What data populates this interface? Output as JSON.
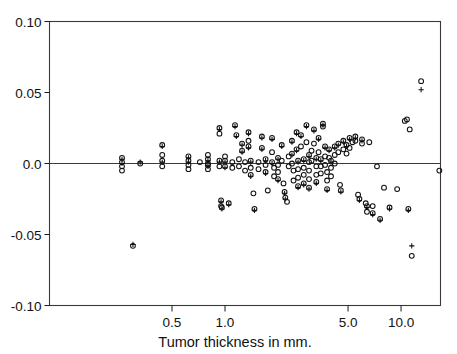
{
  "chart_data": {
    "type": "scatter",
    "title": "",
    "xlabel": "Tumor thickness in mm.",
    "ylabel": "",
    "xscale": "log",
    "yscale": "linear",
    "xlim": [
      0.18,
      20.0
    ],
    "ylim": [
      -0.1,
      0.1
    ],
    "xticks": [
      0.5,
      1.0,
      5.0,
      10.0
    ],
    "xtick_labels": [
      "0.5",
      "1.0",
      "5.0",
      "10.0"
    ],
    "yticks": [
      -0.1,
      -0.05,
      0.0,
      0.05,
      0.1
    ],
    "ytick_labels": [
      "-0.10",
      "-0.05",
      "0.0",
      "0.05",
      "0.10"
    ],
    "grid": false,
    "legend": "none",
    "zero_reference_line": 0.0,
    "marker_styles": [
      "circle",
      "plus"
    ],
    "series": [
      {
        "name": "circle",
        "marker": "circle",
        "points": [
          [
            0.26,
            0.001
          ],
          [
            0.26,
            -0.002
          ],
          [
            0.26,
            0.004
          ],
          [
            0.26,
            -0.005
          ],
          [
            0.33,
            0.0
          ],
          [
            0.3,
            -0.058
          ],
          [
            0.44,
            0.013
          ],
          [
            0.44,
            0.002
          ],
          [
            0.44,
            -0.002
          ],
          [
            0.44,
            0.006
          ],
          [
            0.62,
            0.002
          ],
          [
            0.62,
            -0.001
          ],
          [
            0.62,
            0.005
          ],
          [
            0.62,
            -0.004
          ],
          [
            0.72,
            0.001
          ],
          [
            0.8,
            0.003
          ],
          [
            0.8,
            -0.001
          ],
          [
            0.8,
            0.006
          ],
          [
            0.8,
            -0.004
          ],
          [
            0.8,
            0.0
          ],
          [
            0.93,
            0.025
          ],
          [
            0.93,
            0.021
          ],
          [
            0.93,
            0.002
          ],
          [
            0.93,
            -0.002
          ],
          [
            0.95,
            -0.026
          ],
          [
            0.95,
            -0.03
          ],
          [
            0.96,
            -0.031
          ],
          [
            1.0,
            0.002
          ],
          [
            1.0,
            -0.002
          ],
          [
            1.0,
            0.005
          ],
          [
            1.05,
            -0.028
          ],
          [
            1.1,
            0.001
          ],
          [
            1.1,
            -0.003
          ],
          [
            1.14,
            0.027
          ],
          [
            1.16,
            0.02
          ],
          [
            1.2,
            0.003
          ],
          [
            1.2,
            -0.002
          ],
          [
            1.25,
            0.014
          ],
          [
            1.25,
            0.009
          ],
          [
            1.3,
            0.001
          ],
          [
            1.3,
            -0.005
          ],
          [
            1.36,
            0.022
          ],
          [
            1.36,
            0.016
          ],
          [
            1.36,
            0.012
          ],
          [
            1.4,
            0.002
          ],
          [
            1.4,
            -0.003
          ],
          [
            1.4,
            -0.008
          ],
          [
            1.45,
            -0.021
          ],
          [
            1.47,
            -0.032
          ],
          [
            1.55,
            0.001
          ],
          [
            1.55,
            -0.004
          ],
          [
            1.62,
            0.019
          ],
          [
            1.62,
            0.011
          ],
          [
            1.7,
            0.003
          ],
          [
            1.7,
            -0.001
          ],
          [
            1.7,
            -0.006
          ],
          [
            1.75,
            -0.019
          ],
          [
            1.85,
            0.018
          ],
          [
            1.85,
            0.008
          ],
          [
            1.85,
            0.001
          ],
          [
            1.9,
            -0.003
          ],
          [
            1.9,
            -0.009
          ],
          [
            2.0,
            0.004
          ],
          [
            2.0,
            -0.001
          ],
          [
            2.0,
            -0.006
          ],
          [
            2.0,
            -0.011
          ],
          [
            2.1,
            0.013
          ],
          [
            2.1,
            0.002
          ],
          [
            2.15,
            -0.014
          ],
          [
            2.18,
            -0.02
          ],
          [
            2.2,
            -0.024
          ],
          [
            2.25,
            -0.027
          ],
          [
            2.3,
            0.005
          ],
          [
            2.3,
            -0.002
          ],
          [
            2.4,
            0.016
          ],
          [
            2.4,
            0.007
          ],
          [
            2.4,
            0.0
          ],
          [
            2.45,
            -0.005
          ],
          [
            2.45,
            -0.012
          ],
          [
            2.55,
            0.022
          ],
          [
            2.55,
            0.01
          ],
          [
            2.6,
            0.002
          ],
          [
            2.6,
            -0.004
          ],
          [
            2.6,
            -0.01
          ],
          [
            2.6,
            -0.016
          ],
          [
            2.7,
            0.02
          ],
          [
            2.7,
            0.012
          ],
          [
            2.8,
            0.003
          ],
          [
            2.8,
            -0.003
          ],
          [
            2.8,
            -0.008
          ],
          [
            2.8,
            -0.014
          ],
          [
            2.9,
            0.027
          ],
          [
            2.9,
            0.015
          ],
          [
            3.0,
            0.006
          ],
          [
            3.0,
            0.001
          ],
          [
            3.0,
            -0.005
          ],
          [
            3.0,
            -0.011
          ],
          [
            3.0,
            -0.017
          ],
          [
            3.1,
            0.009
          ],
          [
            3.1,
            0.002
          ],
          [
            3.2,
            0.024
          ],
          [
            3.2,
            0.014
          ],
          [
            3.3,
            0.004
          ],
          [
            3.3,
            -0.002
          ],
          [
            3.3,
            -0.008
          ],
          [
            3.3,
            -0.013
          ],
          [
            3.4,
            0.018
          ],
          [
            3.4,
            0.008
          ],
          [
            3.5,
            0.003
          ],
          [
            3.5,
            -0.002
          ],
          [
            3.5,
            -0.007
          ],
          [
            3.6,
            0.028
          ],
          [
            3.6,
            0.026
          ],
          [
            3.7,
            0.012
          ],
          [
            3.7,
            0.005
          ],
          [
            3.7,
            -0.001
          ],
          [
            3.8,
            -0.006
          ],
          [
            3.8,
            -0.012
          ],
          [
            3.8,
            -0.018
          ],
          [
            3.9,
            0.01
          ],
          [
            3.9,
            0.004
          ],
          [
            4.0,
            0.002
          ],
          [
            4.0,
            -0.003
          ],
          [
            4.0,
            -0.009
          ],
          [
            4.2,
            0.012
          ],
          [
            4.2,
            0.006
          ],
          [
            4.2,
            0.0
          ],
          [
            4.4,
            0.014
          ],
          [
            4.4,
            0.008
          ],
          [
            4.5,
            -0.015
          ],
          [
            4.55,
            -0.019
          ],
          [
            4.7,
            0.016
          ],
          [
            4.7,
            0.01
          ],
          [
            4.9,
            0.013
          ],
          [
            4.9,
            0.007
          ],
          [
            5.1,
            0.018
          ],
          [
            5.1,
            0.011
          ],
          [
            5.3,
            0.015
          ],
          [
            5.5,
            0.019
          ],
          [
            5.5,
            0.016
          ],
          [
            5.7,
            -0.022
          ],
          [
            5.8,
            -0.025
          ],
          [
            6.0,
            0.017
          ],
          [
            6.0,
            0.014
          ],
          [
            6.3,
            -0.028
          ],
          [
            6.4,
            -0.03
          ],
          [
            6.4,
            -0.034
          ],
          [
            6.6,
            0.015
          ],
          [
            6.9,
            -0.03
          ],
          [
            6.9,
            -0.035
          ],
          [
            7.3,
            -0.002
          ],
          [
            7.6,
            -0.039
          ],
          [
            8.0,
            -0.017
          ],
          [
            8.6,
            -0.031
          ],
          [
            9.5,
            -0.018
          ],
          [
            10.5,
            0.03
          ],
          [
            10.8,
            0.031
          ],
          [
            11.0,
            -0.032
          ],
          [
            11.2,
            0.024
          ],
          [
            11.5,
            -0.065
          ],
          [
            13.0,
            0.058
          ],
          [
            16.5,
            -0.005
          ]
        ]
      },
      {
        "name": "plus",
        "marker": "plus",
        "points": [
          [
            0.26,
            0.0
          ],
          [
            0.26,
            0.003
          ],
          [
            0.33,
            0.001
          ],
          [
            0.3,
            -0.057
          ],
          [
            0.44,
            0.012
          ],
          [
            0.44,
            0.001
          ],
          [
            0.62,
            0.001
          ],
          [
            0.62,
            0.004
          ],
          [
            0.8,
            0.002
          ],
          [
            0.8,
            -0.002
          ],
          [
            0.93,
            0.024
          ],
          [
            0.93,
            0.001
          ],
          [
            0.95,
            -0.027
          ],
          [
            0.96,
            -0.032
          ],
          [
            1.0,
            0.001
          ],
          [
            1.0,
            -0.003
          ],
          [
            1.05,
            -0.029
          ],
          [
            1.14,
            0.026
          ],
          [
            1.16,
            0.019
          ],
          [
            1.25,
            0.013
          ],
          [
            1.25,
            0.008
          ],
          [
            1.36,
            0.021
          ],
          [
            1.36,
            0.011
          ],
          [
            1.4,
            0.001
          ],
          [
            1.4,
            -0.009
          ],
          [
            1.47,
            -0.033
          ],
          [
            1.62,
            0.018
          ],
          [
            1.62,
            0.01
          ],
          [
            1.7,
            0.002
          ],
          [
            1.7,
            -0.007
          ],
          [
            1.85,
            0.017
          ],
          [
            1.85,
            0.0
          ],
          [
            2.0,
            0.003
          ],
          [
            2.0,
            -0.012
          ],
          [
            2.1,
            0.012
          ],
          [
            2.18,
            -0.021
          ],
          [
            2.2,
            -0.025
          ],
          [
            2.4,
            0.015
          ],
          [
            2.4,
            0.006
          ],
          [
            2.55,
            0.021
          ],
          [
            2.55,
            0.009
          ],
          [
            2.6,
            0.001
          ],
          [
            2.6,
            -0.017
          ],
          [
            2.7,
            0.019
          ],
          [
            2.8,
            0.002
          ],
          [
            2.8,
            -0.015
          ],
          [
            2.9,
            0.026
          ],
          [
            3.0,
            0.005
          ],
          [
            3.0,
            -0.018
          ],
          [
            3.2,
            0.023
          ],
          [
            3.3,
            0.003
          ],
          [
            3.3,
            -0.014
          ],
          [
            3.4,
            0.017
          ],
          [
            3.5,
            0.002
          ],
          [
            3.6,
            0.027
          ],
          [
            3.7,
            0.011
          ],
          [
            3.8,
            -0.019
          ],
          [
            3.9,
            0.009
          ],
          [
            4.0,
            0.001
          ],
          [
            4.2,
            0.011
          ],
          [
            4.4,
            0.013
          ],
          [
            4.55,
            -0.02
          ],
          [
            4.7,
            0.015
          ],
          [
            4.9,
            0.012
          ],
          [
            5.1,
            0.017
          ],
          [
            5.5,
            0.018
          ],
          [
            5.8,
            -0.026
          ],
          [
            6.0,
            0.016
          ],
          [
            6.4,
            -0.031
          ],
          [
            6.9,
            -0.036
          ],
          [
            7.6,
            -0.04
          ],
          [
            8.6,
            -0.032
          ],
          [
            11.0,
            -0.033
          ],
          [
            11.5,
            -0.058
          ],
          [
            13.0,
            0.052
          ]
        ]
      }
    ]
  }
}
